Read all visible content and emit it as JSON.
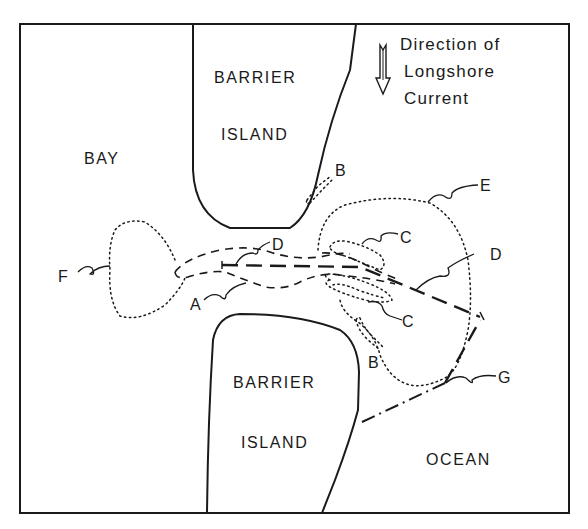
{
  "diagram": {
    "regions": {
      "bay": "BAY",
      "barrier_island_north": [
        "BARRIER",
        "ISLAND"
      ],
      "barrier_island_south": [
        "BARRIER",
        "ISLAND"
      ],
      "ocean": "OCEAN"
    },
    "legend": {
      "icon": "down-arrow-icon",
      "lines": [
        "Direction of",
        "Longshore",
        "Current"
      ]
    },
    "labels": {
      "A": "A",
      "B_north": "B",
      "B_south": "B",
      "C_upper": "C",
      "C_lower": "C",
      "D_inner": "D",
      "D_outer": "D",
      "E": "E",
      "F": "F",
      "G": "G"
    }
  }
}
